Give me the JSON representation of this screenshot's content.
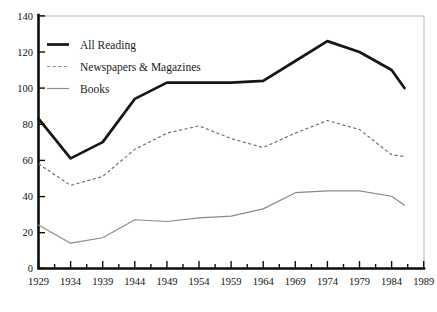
{
  "chart_data": {
    "type": "line",
    "title": "",
    "xlabel": "",
    "ylabel": "",
    "xlim": [
      1929,
      1989
    ],
    "ylim": [
      0,
      140
    ],
    "grid": false,
    "legend_position": "top-left",
    "x": [
      1929,
      1934,
      1939,
      1944,
      1949,
      1954,
      1959,
      1964,
      1969,
      1974,
      1979,
      1984,
      1986
    ],
    "categories": [
      "1929",
      "1934",
      "1939",
      "1944",
      "1949",
      "1954",
      "1959",
      "1964",
      "1969",
      "1974",
      "1979",
      "1984",
      "1989"
    ],
    "xticks": [
      1929,
      1934,
      1939,
      1944,
      1949,
      1954,
      1959,
      1964,
      1969,
      1974,
      1979,
      1984,
      1989
    ],
    "xtick_labels": [
      "1929",
      "1934",
      "1939",
      "1944",
      "1949",
      "1954",
      "1959",
      "1964",
      "1969",
      "1974",
      "1979",
      "1984",
      "1989"
    ],
    "yticks": [
      0,
      20,
      40,
      60,
      80,
      100,
      120,
      140
    ],
    "ytick_labels": [
      "0",
      "20",
      "40",
      "60",
      "80",
      "100",
      "120",
      "140"
    ],
    "series": [
      {
        "name": "All Reading",
        "style": "thick-solid",
        "color": "#161616",
        "values": [
          83,
          61,
          70,
          94,
          103,
          103,
          103,
          104,
          115,
          126,
          120,
          110,
          100
        ]
      },
      {
        "name": "Newspapers & Magazines",
        "style": "dotted",
        "color": "#6e6e6e",
        "values": [
          58,
          46,
          51,
          66,
          75,
          79,
          72,
          67,
          75,
          82,
          77,
          63,
          62
        ]
      },
      {
        "name": "Books",
        "style": "thin-solid",
        "color": "#8a8a8a",
        "values": [
          24,
          14,
          17,
          27,
          26,
          28,
          29,
          33,
          42,
          43,
          43,
          40,
          35
        ]
      }
    ]
  },
  "legend": {
    "items": [
      {
        "label": "All Reading",
        "swatch": "thick-solid-line-icon"
      },
      {
        "label": "Newspapers & Magazines",
        "swatch": "dotted-line-icon"
      },
      {
        "label": "Books",
        "swatch": "thin-solid-line-icon"
      }
    ]
  },
  "axes": {
    "y_max_label": "140",
    "y_min_label": "0"
  }
}
